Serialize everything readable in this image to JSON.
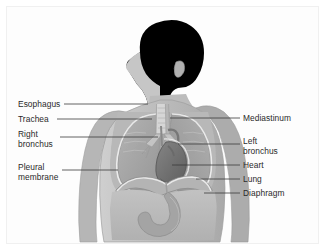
{
  "figure": {
    "type": "anatomical-diagram",
    "view": "anterior torso with head in left profile",
    "frame_color": "#f0f0f0",
    "background_color": "#ffffff",
    "body_fill": "#bdbdbd",
    "body_outline": "#9a9a9a",
    "lung_fill": "#a8a8a8",
    "heart_fill": "#6f6f6f",
    "airway_fill": "#d8d8d8",
    "pleura_stroke": "#f2f2f2",
    "diaphragm_fill": "#b0b0b0",
    "stomach_fill": "#a2a2a2",
    "leader_line_color": "#3a3a3a",
    "label_text_color": "#2a2a2a"
  },
  "labels": {
    "left": [
      {
        "id": "esophagus",
        "lines": [
          "Esophagus"
        ],
        "text_x": 18,
        "text_y": 99,
        "leader_x1": 64,
        "leader_x2": 148,
        "leader_y": 104
      },
      {
        "id": "trachea",
        "lines": [
          "Trachea"
        ],
        "text_x": 18,
        "text_y": 114,
        "leader_x1": 57,
        "leader_x2": 152,
        "leader_y": 119
      },
      {
        "id": "right-bronchus",
        "lines": [
          "Right",
          "bronchus"
        ],
        "text_x": 18,
        "text_y": 129,
        "leader_x1": 60,
        "leader_x2": 158,
        "leader_y": 137
      },
      {
        "id": "pleural-membrane",
        "lines": [
          "Pleural",
          "membrane"
        ],
        "text_x": 18,
        "text_y": 162,
        "leader_x1": 62,
        "leader_x2": 118,
        "leader_y": 170
      }
    ],
    "right": [
      {
        "id": "mediastinum",
        "lines": [
          "Mediastinum"
        ],
        "text_x": 243,
        "text_y": 113,
        "leader_x1": 170,
        "leader_x2": 240,
        "leader_y": 118
      },
      {
        "id": "left-bronchus",
        "lines": [
          "Left",
          "bronchus"
        ],
        "text_x": 243,
        "text_y": 136,
        "leader_x1": 178,
        "leader_x2": 240,
        "leader_y": 144
      },
      {
        "id": "heart",
        "lines": [
          "Heart"
        ],
        "text_x": 243,
        "text_y": 160,
        "leader_x1": 172,
        "leader_x2": 240,
        "leader_y": 165
      },
      {
        "id": "lung",
        "lines": [
          "Lung"
        ],
        "text_x": 243,
        "text_y": 174,
        "leader_x1": 196,
        "leader_x2": 240,
        "leader_y": 179
      },
      {
        "id": "diaphragm",
        "lines": [
          "Diaphragm"
        ],
        "text_x": 243,
        "text_y": 188,
        "leader_x1": 204,
        "leader_x2": 240,
        "leader_y": 193
      }
    ]
  }
}
